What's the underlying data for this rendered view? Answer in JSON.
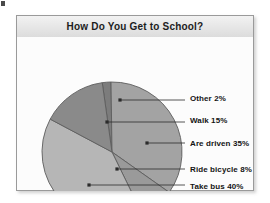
{
  "corner_mark": {
    "name": "page-corner-mark"
  },
  "frame": {
    "title": "How Do You Get to School?"
  },
  "chart_data": {
    "type": "pie",
    "title": "How Do You Get to School?",
    "xlabel": "",
    "ylabel": "",
    "legend_position": "right",
    "grid": false,
    "categories": [
      "Other",
      "Are driven",
      "Ride bicycle",
      "Take bus",
      "Walk"
    ],
    "values": [
      2,
      35,
      8,
      40,
      15
    ],
    "labels": [
      "Other 2%",
      "Walk 15%",
      "Are driven 35%",
      "Ride bicycle 8%",
      "Take bus 40%"
    ],
    "slices": [
      {
        "name": "Other",
        "label": "Other 2%",
        "value": 2,
        "color": "#7c7c7c",
        "start_deg": 352.0,
        "end_deg": 359.2,
        "label_x": 173,
        "label_y": 62,
        "dot_x": 103,
        "dot_y": 63,
        "leader_to_x": 168
      },
      {
        "name": "Are driven",
        "label": "Are driven 35%",
        "value": 35,
        "color": "#a3a3a3",
        "start_deg": 359.2,
        "end_deg": 485.2,
        "label_x": 173,
        "label_y": 107,
        "dot_x": 130,
        "dot_y": 106,
        "leader_to_x": 168
      },
      {
        "name": "Ride bicycle",
        "label": "Ride bicycle 8%",
        "value": 8,
        "color": "#9a9a9a",
        "start_deg": 485.2,
        "end_deg": 514.0,
        "label_x": 173,
        "label_y": 133,
        "dot_x": 100,
        "dot_y": 132,
        "leader_to_x": 168
      },
      {
        "name": "Take bus",
        "label": "Take bus 40%",
        "value": 40,
        "color": "#b6b6b6",
        "start_deg": 514.0,
        "end_deg": 658.0,
        "label_x": 173,
        "label_y": 150,
        "dot_x": 72,
        "dot_y": 148,
        "leader_to_x": 168
      },
      {
        "name": "Walk",
        "label": "Walk 15%",
        "value": 15,
        "color": "#8a8a8a",
        "start_deg": 658.0,
        "end_deg": 712.0,
        "label_x": 173,
        "label_y": 84,
        "dot_x": 90,
        "dot_y": 85,
        "leader_to_x": 168
      }
    ],
    "geometry": {
      "cx": 95,
      "cy": 115,
      "r": 70
    },
    "colors": {
      "other": "#7c7c7c",
      "are_driven": "#a3a3a3",
      "ride_bicycle": "#9a9a9a",
      "take_bus": "#b6b6b6",
      "walk": "#8a8a8a",
      "outline": "#5e5e5e",
      "leader": "#2b2b2b"
    }
  }
}
